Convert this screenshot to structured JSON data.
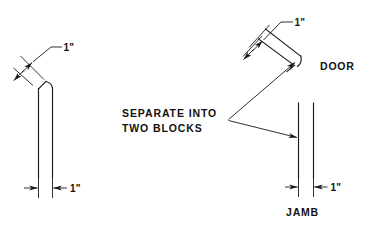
{
  "drawing": {
    "title": "Door and jamb separation detail",
    "line_color": "#1a1a1a",
    "background": "#ffffff",
    "labels": {
      "note_line1": "SEPARATE INTO",
      "note_line2": "TWO BLOCKS",
      "door": "DOOR",
      "jamb": "JAMB"
    },
    "dimensions": {
      "left_top": "1\"",
      "left_bottom": "1\"",
      "door_top": "1\"",
      "jamb_bottom": "1\""
    }
  }
}
